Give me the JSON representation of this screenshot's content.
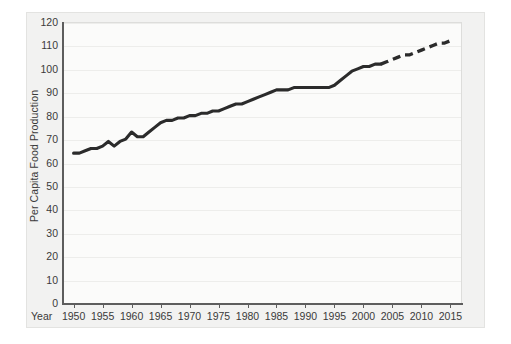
{
  "chart_data": {
    "type": "line",
    "title": "",
    "subtitle": "",
    "xlabel": "Year",
    "ylabel": "Per Capita Food Production",
    "xlim": [
      1948,
      2017
    ],
    "ylim": [
      0,
      120
    ],
    "grid": true,
    "legend": "none",
    "x_ticks": [
      1950,
      1955,
      1960,
      1965,
      1970,
      1975,
      1980,
      1985,
      1990,
      1995,
      2000,
      2005,
      2010,
      2015
    ],
    "y_ticks": [
      0,
      10,
      20,
      30,
      40,
      50,
      60,
      70,
      80,
      90,
      100,
      110,
      120
    ],
    "line_color": "#2b2b2b",
    "series": [
      {
        "name": "Per Capita Food Production (historical)",
        "style": "solid",
        "x": [
          1950,
          1951,
          1952,
          1953,
          1954,
          1955,
          1956,
          1957,
          1958,
          1959,
          1960,
          1961,
          1962,
          1963,
          1964,
          1965,
          1966,
          1967,
          1968,
          1969,
          1970,
          1971,
          1972,
          1973,
          1974,
          1975,
          1976,
          1977,
          1978,
          1979,
          1980,
          1981,
          1982,
          1983,
          1984,
          1985,
          1986,
          1987,
          1988,
          1989,
          1990,
          1991,
          1992,
          1993,
          1994,
          1995,
          1996,
          1997,
          1998,
          1999,
          2000,
          2001,
          2002,
          2003
        ],
        "y": [
          64,
          64,
          65,
          66,
          66,
          67,
          69,
          67,
          69,
          70,
          73,
          71,
          71,
          73,
          75,
          77,
          78,
          78,
          79,
          79,
          80,
          80,
          81,
          81,
          82,
          82,
          83,
          84,
          85,
          85,
          86,
          87,
          88,
          89,
          90,
          91,
          91,
          91,
          92,
          92,
          92,
          92,
          92,
          92,
          92,
          93,
          95,
          97,
          99,
          100,
          101,
          101,
          102,
          102
        ]
      },
      {
        "name": "Per Capita Food Production (projected)",
        "style": "dashed",
        "x": [
          2003,
          2004,
          2005,
          2006,
          2007,
          2008,
          2009,
          2010,
          2011,
          2012,
          2013,
          2014,
          2015
        ],
        "y": [
          102,
          103,
          104,
          105,
          106,
          106,
          107,
          108,
          109,
          110,
          111,
          111,
          112
        ]
      }
    ]
  },
  "axes": {
    "x_label": "Year",
    "y_label": "Per Capita Food Production",
    "x_tick_labels": [
      "1950",
      "1955",
      "1960",
      "1965",
      "1970",
      "1975",
      "1980",
      "1985",
      "1990",
      "1995",
      "2000",
      "2005",
      "2010",
      "2015"
    ],
    "y_tick_labels": [
      "120",
      "110",
      "100",
      "90",
      "80",
      "70",
      "60",
      "50",
      "40",
      "30",
      "20",
      "10",
      "0"
    ]
  }
}
